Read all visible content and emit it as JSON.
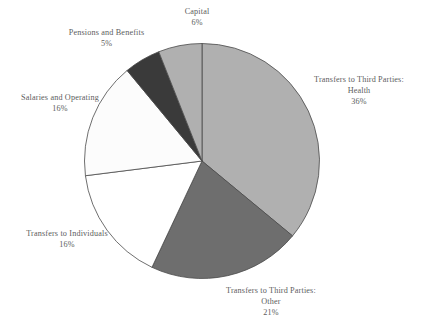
{
  "chart_data": {
    "type": "pie",
    "title": "",
    "subtitle": "",
    "xlabel": "",
    "ylabel": "",
    "legend_position": "none",
    "grid": false,
    "start_angle_deg": 0,
    "direction": "clockwise",
    "categories": [
      "Transfers to Third Parties: Health",
      "Transfers to Third Parties: Other",
      "Transfers to Individuals",
      "Salaries and Operating",
      "Pensions and Benefits",
      "Capital"
    ],
    "values": [
      36,
      21,
      16,
      16,
      5,
      6
    ],
    "value_unit": "%",
    "slices": [
      {
        "name": "health",
        "label_line1": "Transfers to Third Parties:",
        "label_line2": "Health",
        "percent_text": "36%",
        "value": 36,
        "color": "#b0b0b0",
        "stroke": "#4a4a4a"
      },
      {
        "name": "other",
        "label_line1": "Transfers to Third Parties:",
        "label_line2": "Other",
        "percent_text": "21%",
        "value": 21,
        "color": "#6e6e6e",
        "stroke": "#4a4a4a"
      },
      {
        "name": "transfers-to-individuals",
        "label_line1": "Transfers to Individuals",
        "label_line2": "",
        "percent_text": "16%",
        "value": 16,
        "color": "#ffffff",
        "stroke": "#4a4a4a"
      },
      {
        "name": "salaries-and-operating",
        "label_line1": "Salaries and Operating",
        "label_line2": "",
        "percent_text": "16%",
        "value": 16,
        "color": "#fcfcfc",
        "stroke": "#4a4a4a"
      },
      {
        "name": "pensions-and-benefits",
        "label_line1": "Pensions and Benefits",
        "label_line2": "",
        "percent_text": "5%",
        "value": 5,
        "color": "#3a3a3a",
        "stroke": "#4a4a4a"
      },
      {
        "name": "capital",
        "label_line1": "Capital",
        "label_line2": "",
        "percent_text": "6%",
        "value": 6,
        "color": "#b0b0b0",
        "stroke": "#4a4a4a"
      }
    ]
  }
}
